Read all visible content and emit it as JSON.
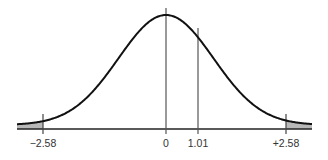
{
  "chart_data": {
    "type": "line",
    "title": "",
    "subtitle": "Standard normal curve with two-tailed rejection regions",
    "xlabel": "",
    "ylabel": "",
    "grid": false,
    "legend": null,
    "x_tick_labels": [
      "−2.58",
      "0",
      "1.01",
      "+2.58"
    ],
    "x_ticks": [
      -2.58,
      0,
      1.01,
      2.58
    ],
    "markers": [
      {
        "x": 0,
        "label": "0",
        "kind": "mean"
      },
      {
        "x": 1.01,
        "label": "1.01",
        "kind": "test-statistic"
      },
      {
        "x": -2.58,
        "label": "−2.58",
        "kind": "critical-value"
      },
      {
        "x": 2.58,
        "label": "+2.58",
        "kind": "critical-value"
      }
    ],
    "shaded_regions": [
      {
        "from": "-inf",
        "to": -2.58,
        "name": "left-rejection-region"
      },
      {
        "from": 2.58,
        "to": "inf",
        "name": "right-rejection-region"
      }
    ],
    "series": [
      {
        "name": "standard-normal-density",
        "distribution": "normal",
        "mean": 0,
        "sd": 1
      }
    ],
    "xlim": [
      -3.1,
      3.1
    ]
  },
  "colors": {
    "curve": "#111111",
    "axis": "#222222",
    "marker_line": "#444444",
    "shade": "#b8b8b8",
    "label": "#333333"
  }
}
